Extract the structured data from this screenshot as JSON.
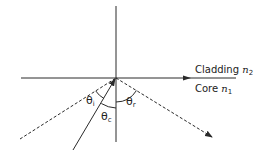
{
  "diagram": {
    "labels": {
      "cladding": "Cladding",
      "cladding_index": "n",
      "cladding_index_sub": "2",
      "core": "Core",
      "core_index": "n",
      "core_index_sub": "1",
      "theta_i": "θ",
      "theta_i_sub": "i",
      "theta_c": "θ",
      "theta_c_sub": "c",
      "theta_r": "θ",
      "theta_r_sub": "r"
    },
    "colors": {
      "line": "#2a2a2a",
      "background": "#ffffff"
    }
  }
}
